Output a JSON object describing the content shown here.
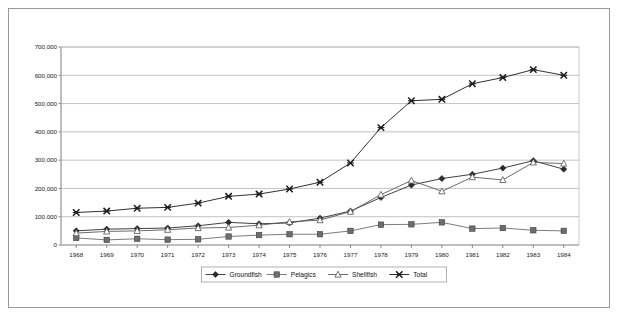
{
  "chart_data": {
    "type": "line",
    "title": "",
    "xlabel": "",
    "ylabel": "",
    "grid": true,
    "legend_position": "bottom",
    "x": [
      1968,
      1969,
      1970,
      1971,
      1972,
      1973,
      1974,
      1975,
      1976,
      1977,
      1978,
      1979,
      1980,
      1981,
      1982,
      1983,
      1984
    ],
    "categories": [
      "1968",
      "1969",
      "1970",
      "1971",
      "1972",
      "1973",
      "1974",
      "1975",
      "1976",
      "1977",
      "1978",
      "1979",
      "1980",
      "1981",
      "1982",
      "1983",
      "1984"
    ],
    "ylim": [
      0,
      700000
    ],
    "yticks": [
      0,
      100000,
      200000,
      300000,
      400000,
      500000,
      600000,
      700000
    ],
    "ytick_labels": [
      "0",
      "100,000",
      "200,000",
      "300,000",
      "400,000",
      "500,000",
      "600,000",
      "700,000"
    ],
    "series": [
      {
        "name": "Groundfish",
        "marker": "filled-diamond",
        "color": "#2b2b2b",
        "values": [
          50000,
          56000,
          58000,
          60000,
          68000,
          80000,
          75000,
          78000,
          95000,
          120000,
          168000,
          212000,
          235000,
          250000,
          272000,
          298000,
          268000
        ]
      },
      {
        "name": "Pelagics",
        "marker": "filled-square",
        "color": "#6e6e6e",
        "values": [
          25000,
          18000,
          22000,
          19000,
          20000,
          30000,
          35000,
          38000,
          38000,
          50000,
          72000,
          73000,
          80000,
          58000,
          60000,
          52000,
          50000
        ]
      },
      {
        "name": "Shellfish",
        "marker": "open-triangle",
        "color": "#5a5a5a",
        "values": [
          42000,
          48000,
          50000,
          54000,
          60000,
          62000,
          70000,
          82000,
          88000,
          118000,
          178000,
          228000,
          190000,
          240000,
          230000,
          292000,
          288000
        ]
      },
      {
        "name": "Total",
        "marker": "x-cross",
        "color": "#1a1a1a",
        "values": [
          115000,
          120000,
          130000,
          133000,
          148000,
          172000,
          180000,
          198000,
          222000,
          290000,
          415000,
          510000,
          515000,
          570000,
          592000,
          620000,
          600000
        ]
      }
    ]
  },
  "legend": {
    "entries": [
      {
        "label": "Groundfish",
        "marker": "filled-diamond"
      },
      {
        "label": "Pelagics",
        "marker": "filled-square"
      },
      {
        "label": "Shellfish",
        "marker": "open-triangle"
      },
      {
        "label": "Total",
        "marker": "x-cross"
      }
    ]
  },
  "colors": {
    "background": "#ffffff",
    "frame": "#9a9a9a",
    "gridline": "#a8a8a8",
    "axis": "#6d6d6d",
    "text": "#1a1a1a"
  }
}
